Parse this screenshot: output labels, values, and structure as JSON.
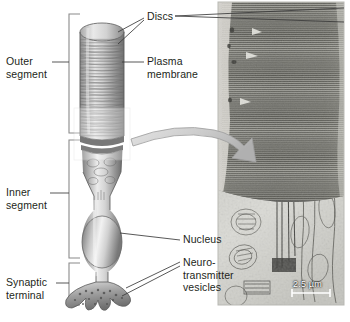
{
  "figure": {
    "background_color": "#ffffff"
  },
  "labels": {
    "outer_segment": "Outer\nsegment",
    "inner_segment": "Inner\nsegment",
    "synaptic_terminal": "Synaptic\nterminal",
    "discs": "Discs",
    "plasma_membrane": "Plasma\nmembrane",
    "nucleus": "Nucleus",
    "neurotransmitter_vesicles": "Neuro-\ntransmitter\nvesicles"
  },
  "micrograph": {
    "scale_bar_label": "2.5 µm",
    "caption_color": "#ffffff"
  },
  "colors": {
    "label_text": "#231f20",
    "leader_line": "#3a3a3a",
    "bracket": "#6e6e6e",
    "cell_light": "#e8e8e8",
    "cell_mid": "#b4b4b4",
    "cell_dark": "#6b6b6b",
    "arrow": "#c9c9c9",
    "micrograph_dark": "#5b5b5b",
    "micrograph_light": "#d8d8d4"
  }
}
